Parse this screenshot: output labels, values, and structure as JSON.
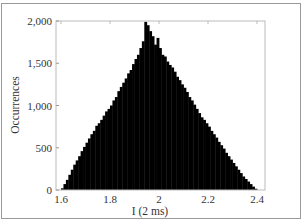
{
  "chart_data": {
    "type": "bar",
    "title": "",
    "xlabel": "I (2 ms)",
    "ylabel": "Occurrences",
    "xlim": [
      1.6,
      2.4
    ],
    "ylim": [
      0,
      2000
    ],
    "xticks": [
      "1.6",
      "1.8",
      "2",
      "2.2",
      "2.4"
    ],
    "yticks": [
      "0",
      "500",
      "1,000",
      "1,500",
      "2,000"
    ],
    "grid": false,
    "legend": null,
    "bar_color": "#000000",
    "bin_width": 0.01,
    "x": [
      1.6,
      1.61,
      1.62,
      1.63,
      1.64,
      1.65,
      1.66,
      1.67,
      1.68,
      1.69,
      1.7,
      1.71,
      1.72,
      1.73,
      1.74,
      1.75,
      1.76,
      1.77,
      1.78,
      1.79,
      1.8,
      1.81,
      1.82,
      1.83,
      1.84,
      1.85,
      1.86,
      1.87,
      1.88,
      1.89,
      1.9,
      1.91,
      1.92,
      1.93,
      1.94,
      1.95,
      1.96,
      1.97,
      1.98,
      1.99,
      2.0,
      2.01,
      2.02,
      2.03,
      2.04,
      2.05,
      2.06,
      2.07,
      2.08,
      2.09,
      2.1,
      2.11,
      2.12,
      2.13,
      2.14,
      2.15,
      2.16,
      2.17,
      2.18,
      2.19,
      2.2,
      2.21,
      2.22,
      2.23,
      2.24,
      2.25,
      2.26,
      2.27,
      2.28,
      2.29,
      2.3,
      2.31,
      2.32,
      2.33,
      2.34,
      2.35,
      2.36,
      2.37,
      2.38,
      2.39
    ],
    "values": [
      20,
      70,
      120,
      180,
      240,
      300,
      350,
      400,
      460,
      510,
      560,
      610,
      660,
      700,
      760,
      790,
      830,
      880,
      930,
      960,
      1000,
      1060,
      1100,
      1170,
      1220,
      1270,
      1320,
      1380,
      1420,
      1490,
      1550,
      1600,
      1680,
      1760,
      1990,
      1950,
      1880,
      1820,
      1720,
      1800,
      1680,
      1600,
      1580,
      1520,
      1480,
      1450,
      1400,
      1340,
      1300,
      1250,
      1210,
      1160,
      1100,
      1060,
      1010,
      960,
      910,
      860,
      830,
      790,
      750,
      700,
      660,
      620,
      570,
      530,
      490,
      440,
      400,
      360,
      320,
      280,
      240,
      200,
      160,
      130,
      100,
      70,
      40,
      15
    ]
  },
  "axes": {
    "xlabel": "I (2 ms)",
    "ylabel": "Occurrences"
  }
}
